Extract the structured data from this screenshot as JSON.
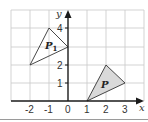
{
  "diagram": {
    "type": "coordinate-grid-transformation",
    "x_axis": {
      "label": "x",
      "ticks": [
        "-2",
        "-1",
        "0",
        "1",
        "2",
        "3"
      ],
      "range": [
        -3,
        4
      ]
    },
    "y_axis": {
      "label": "y",
      "ticks": [
        "1",
        "2",
        "4"
      ],
      "range": [
        0,
        5
      ]
    },
    "shapes": [
      {
        "name": "P",
        "label": "P",
        "subscript": "",
        "vertices": [
          [
            1,
            0
          ],
          [
            2,
            2
          ],
          [
            3,
            1
          ]
        ],
        "fill": "#d9d9d9",
        "stroke": "#333333"
      },
      {
        "name": "P1",
        "label": "P",
        "subscript": "1",
        "vertices": [
          [
            -2,
            2
          ],
          [
            -1,
            4
          ],
          [
            0,
            3
          ]
        ],
        "fill": "none",
        "stroke": "#333333"
      }
    ],
    "colors": {
      "grid": "#c8c8c8",
      "axis": "#1a1a1a",
      "shaded": "#d9d9d9"
    }
  }
}
